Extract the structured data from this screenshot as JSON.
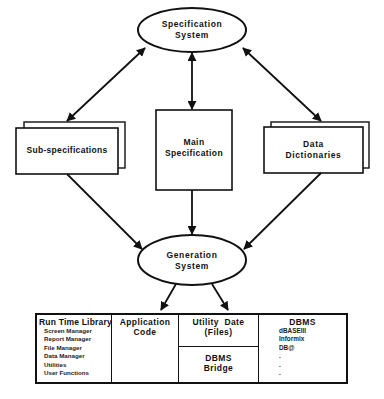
{
  "diagram": {
    "nodes": {
      "spec_system": {
        "line1": "Specification",
        "line2": "System",
        "shape": "ellipse"
      },
      "sub_specs": {
        "label": "Sub-specifications",
        "shape": "stacked-rect"
      },
      "main_spec": {
        "line1": "Main",
        "line2": "Specification",
        "shape": "rect"
      },
      "data_dicts": {
        "line1": "Data",
        "line2": "Dictionaries",
        "shape": "stacked-rect"
      },
      "gen_system": {
        "line1": "Generation",
        "line2": "System",
        "shape": "ellipse"
      }
    },
    "edges": [
      {
        "from": "spec_system",
        "to": "sub_specs",
        "direction": "both"
      },
      {
        "from": "spec_system",
        "to": "main_spec",
        "direction": "both"
      },
      {
        "from": "spec_system",
        "to": "data_dicts",
        "direction": "both"
      },
      {
        "from": "sub_specs",
        "to": "gen_system",
        "direction": "forward"
      },
      {
        "from": "main_spec",
        "to": "gen_system",
        "direction": "forward"
      },
      {
        "from": "data_dicts",
        "to": "gen_system",
        "direction": "forward"
      },
      {
        "from": "gen_system",
        "to": "application_code",
        "direction": "forward"
      },
      {
        "from": "gen_system",
        "to": "utility_files",
        "direction": "forward"
      }
    ],
    "output_table": {
      "runtime": {
        "title": "Run Time Library",
        "items": [
          "Screen Manager",
          "Report Manager",
          "File Manager",
          "Data Manager",
          "Utilities",
          "User Functions"
        ]
      },
      "application": {
        "line1": "Application",
        "line2": "Code"
      },
      "utility": {
        "line1": "Utility  Date",
        "line2": "(Files)"
      },
      "bridge": {
        "line1": "DBMS",
        "line2": "Bridge"
      },
      "dbms": {
        "title": "DBMS",
        "items": [
          "dBASEIII",
          "Informix",
          "DB@",
          ".",
          ".",
          "."
        ]
      }
    },
    "colors": {
      "ink": "#111111",
      "paper": "#ffffff"
    }
  }
}
